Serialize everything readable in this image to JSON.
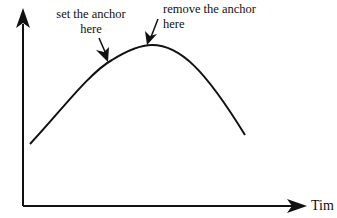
{
  "diagram": {
    "type": "curve-annotation",
    "x_axis": {
      "label": "Tim"
    },
    "y_axis": {
      "label": ""
    },
    "curve": {
      "shape": "single-peak hump",
      "color": "#111111"
    },
    "annotations": [
      {
        "id": "set-anchor",
        "line1": "set the anchor",
        "line2": "here"
      },
      {
        "id": "remove-anchor",
        "line1": "remove the anchor",
        "line2": "here"
      }
    ]
  },
  "colors": {
    "ink": "#111111",
    "background": "#ffffff"
  }
}
